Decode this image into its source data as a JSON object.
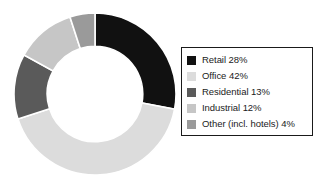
{
  "chart_data": {
    "type": "pie",
    "variant": "donut",
    "title": "",
    "subtitle": "",
    "xlabel": "",
    "ylabel": "",
    "grid": false,
    "legend_position": "right",
    "start_angle_deg": 0,
    "direction": "clockwise",
    "inner_radius_ratio": 0.59,
    "separator_color": "#ffffff",
    "categories": [
      "Retail",
      "Office",
      "Residential",
      "Industrial",
      "Other (incl. hotels)"
    ],
    "values": [
      28,
      42,
      13,
      12,
      4
    ],
    "unit": "%",
    "colors": [
      "#111111",
      "#dcdcdc",
      "#5a5a5a",
      "#c6c6c6",
      "#9a9a9a"
    ],
    "slices": [
      {
        "label": "Retail",
        "value": 28,
        "display": "Retail 28%",
        "color": "#111111",
        "start_deg": 0,
        "end_deg": 100.8
      },
      {
        "label": "Office",
        "value": 42,
        "display": "Office 42%",
        "color": "#dcdcdc",
        "start_deg": 100.8,
        "end_deg": 252.0
      },
      {
        "label": "Residential",
        "value": 13,
        "display": "Residential 13%",
        "color": "#5a5a5a",
        "start_deg": 252.0,
        "end_deg": 298.8
      },
      {
        "label": "Industrial",
        "value": 12,
        "display": "Industrial 12%",
        "color": "#c6c6c6",
        "start_deg": 298.8,
        "end_deg": 342.0
      },
      {
        "label": "Other (incl. hotels)",
        "value": 4,
        "display": "Other (incl. hotels) 4%",
        "color": "#9a9a9a",
        "start_deg": 342.0,
        "end_deg": 360.0
      }
    ]
  },
  "legend": {
    "items": [
      {
        "label": "Retail 28%",
        "color": "#111111"
      },
      {
        "label": "Office 42%",
        "color": "#dcdcdc"
      },
      {
        "label": "Residential 13%",
        "color": "#5a5a5a"
      },
      {
        "label": "Industrial 12%",
        "color": "#c6c6c6"
      },
      {
        "label": "Other (incl. hotels) 4%",
        "color": "#9a9a9a"
      }
    ]
  }
}
